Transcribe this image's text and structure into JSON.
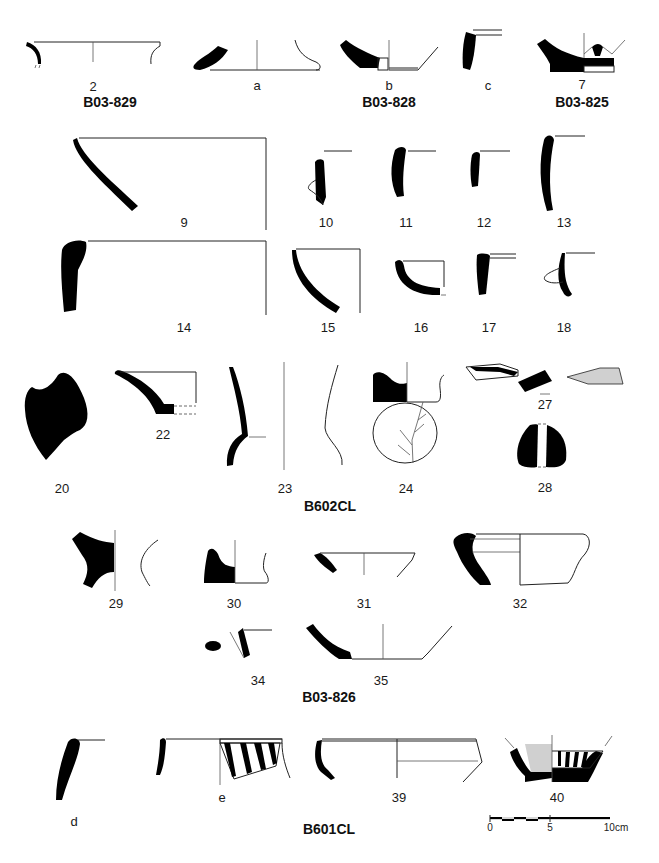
{
  "figure": {
    "type": "archaeological pottery drawing plate",
    "colors": {
      "section_fill": "#000000",
      "line": "#222222",
      "paint_fill": "#d0d0d0",
      "background": "#ffffff"
    }
  },
  "contexts": [
    {
      "id": "B03-829",
      "label": "B03-829",
      "items": [
        "2"
      ]
    },
    {
      "id": "B03-828",
      "label": "B03-828",
      "items": [
        "a",
        "b",
        "c"
      ]
    },
    {
      "id": "B03-825",
      "label": "B03-825",
      "items": [
        "7"
      ]
    },
    {
      "id": "B602CL",
      "label": "B602CL",
      "items": [
        "9",
        "10",
        "11",
        "12",
        "13",
        "14",
        "15",
        "16",
        "17",
        "18",
        "20",
        "22",
        "23",
        "24",
        "27",
        "28"
      ]
    },
    {
      "id": "B03-826",
      "label": "B03-826",
      "items": [
        "29",
        "30",
        "31",
        "32",
        "34",
        "35"
      ]
    },
    {
      "id": "B601CL",
      "label": "B601CL",
      "items": [
        "d",
        "e",
        "39",
        "40"
      ]
    }
  ],
  "labels": {
    "n2": "2",
    "na": "a",
    "nb": "b",
    "nc": "c",
    "n7": "7",
    "n9": "9",
    "n10": "10",
    "n11": "11",
    "n12": "12",
    "n13": "13",
    "n14": "14",
    "n15": "15",
    "n16": "16",
    "n17": "17",
    "n18": "18",
    "n20": "20",
    "n22": "22",
    "n23": "23",
    "n24": "24",
    "n27": "27",
    "n28": "28",
    "n29": "29",
    "n30": "30",
    "n31": "31",
    "n32": "32",
    "n34": "34",
    "n35": "35",
    "nd": "d",
    "ne": "e",
    "n39": "39",
    "n40": "40"
  },
  "context_labels": {
    "b03_829": "B03-829",
    "b03_828": "B03-828",
    "b03_825": "B03-825",
    "b602cl": "B602CL",
    "b03_826": "B03-826",
    "b601cl": "B601CL"
  },
  "scale_bar": {
    "ticks": [
      "0",
      "5",
      "10cm"
    ],
    "length_cm": 10
  }
}
